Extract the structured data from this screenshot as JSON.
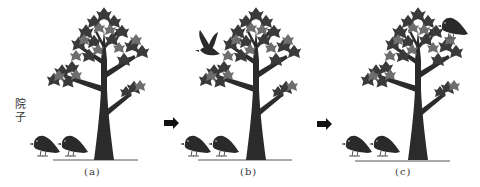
{
  "side_label": "院子",
  "panels": [
    {
      "caption": "(a)",
      "flying_bird": false,
      "perched_bird": false,
      "ground_birds": 2
    },
    {
      "caption": "(b)",
      "flying_bird": true,
      "perched_bird": false,
      "ground_birds": 2
    },
    {
      "caption": "(c)",
      "flying_bird": false,
      "perched_bird": true,
      "ground_birds": 2
    }
  ],
  "arrows": [
    "right-arrow",
    "right-arrow"
  ],
  "colors": {
    "trunk": "#2b2b2b",
    "leaf_dark": "#3a3a3a",
    "leaf_mid": "#6e6e6e",
    "bird": "#2a2a2a",
    "ground": "#555555",
    "text": "#333333"
  }
}
